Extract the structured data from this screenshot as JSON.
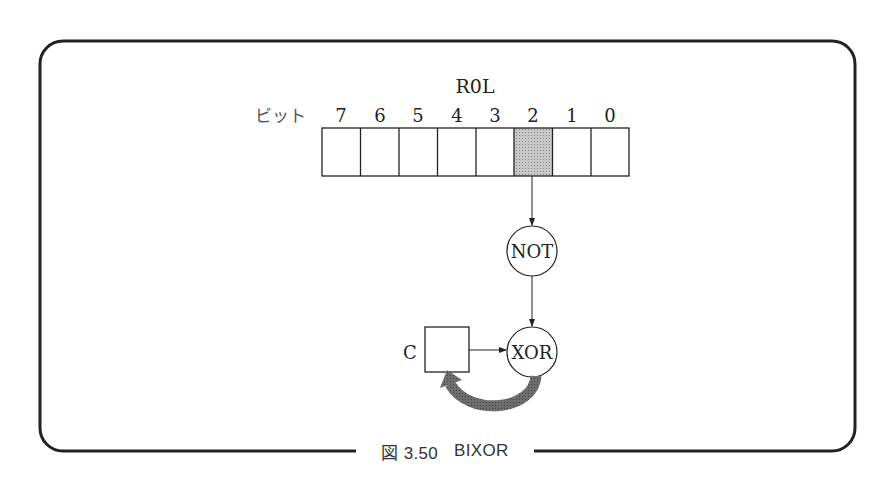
{
  "figure": {
    "caption_prefix": "図 3.50",
    "caption_title": "BIXOR"
  },
  "register": {
    "name": "R0L",
    "bit_label": "ビット",
    "bits": [
      "7",
      "6",
      "5",
      "4",
      "3",
      "2",
      "1",
      "0"
    ],
    "highlighted_bit": "2",
    "highlight_color": "#bdbdbd"
  },
  "nodes": {
    "not_gate": "NOT",
    "xor_gate": "XOR",
    "carry_label": "C"
  },
  "colors": {
    "line": "#222222",
    "thick_arrow": "#666666",
    "frame": "#222222"
  }
}
